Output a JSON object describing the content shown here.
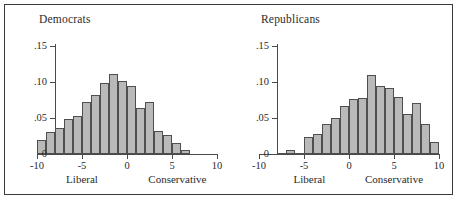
{
  "figure": {
    "background": "#ffffff",
    "frame_color": "#3a3a3a",
    "bar_fill": "#b9b9b9",
    "bar_stroke": "#4f4f4f",
    "axis_color": "#4a4a4a"
  },
  "chart_data": [
    {
      "type": "bar",
      "title": "Democrats",
      "xlabel": "",
      "ylabel": "",
      "xlim": [
        -10,
        10
      ],
      "ylim": [
        0,
        0.15
      ],
      "grid": false,
      "legend": "none",
      "xticks": [
        -10,
        -5,
        0,
        5,
        10
      ],
      "xtick_labels": [
        "-10",
        "-5",
        "0",
        "5",
        "10"
      ],
      "yticks": [
        0,
        0.05,
        0.1,
        0.15
      ],
      "ytick_labels": [
        "0",
        ".05",
        ".10",
        ".15"
      ],
      "annotations": [
        {
          "text": "Liberal",
          "x": -5
        },
        {
          "text": "Conservative",
          "x": 5.6
        }
      ],
      "bin_width": 1,
      "bin_centers": [
        -9.5,
        -8.5,
        -7.5,
        -6.5,
        -5.5,
        -4.5,
        -3.5,
        -2.5,
        -1.5,
        -0.5,
        0.5,
        1.5,
        2.5,
        3.5,
        4.5,
        5.5,
        6.5
      ],
      "values": [
        0.02,
        0.031,
        0.036,
        0.049,
        0.053,
        0.072,
        0.082,
        0.099,
        0.111,
        0.101,
        0.094,
        0.064,
        0.072,
        0.032,
        0.027,
        0.015,
        0.006
      ]
    },
    {
      "type": "bar",
      "title": "Republicans",
      "xlabel": "",
      "ylabel": "",
      "xlim": [
        -10,
        10
      ],
      "ylim": [
        0,
        0.15
      ],
      "grid": false,
      "legend": "none",
      "xticks": [
        -10,
        -5,
        0,
        5,
        10
      ],
      "xtick_labels": [
        "-10",
        "-5",
        "0",
        "5",
        "10"
      ],
      "yticks": [
        0,
        0.05,
        0.1,
        0.15
      ],
      "ytick_labels": [
        "0",
        ".05",
        ".10",
        ".15"
      ],
      "annotations": [
        {
          "text": "Liberal",
          "x": -4.4
        },
        {
          "text": "Conservative",
          "x": 5.0
        }
      ],
      "bin_width": 1,
      "bin_centers": [
        -7.5,
        -6.5,
        -5.5,
        -4.5,
        -3.5,
        -2.5,
        -1.5,
        -0.5,
        0.5,
        1.5,
        2.5,
        3.5,
        4.5,
        5.5,
        6.5,
        7.5,
        8.5,
        9.5
      ],
      "values": [
        0.002,
        0.005,
        0.002,
        0.023,
        0.028,
        0.041,
        0.05,
        0.066,
        0.076,
        0.078,
        0.11,
        0.094,
        0.091,
        0.079,
        0.055,
        0.071,
        0.041,
        0.016,
        0.002
      ]
    }
  ],
  "panels": [
    {
      "name": "democrats",
      "title": "Democrats",
      "liberal_label": "Liberal",
      "conservative_label": "Conservative"
    },
    {
      "name": "republicans",
      "title": "Republicans",
      "liberal_label": "Liberal",
      "conservative_label": "Conservative"
    }
  ]
}
